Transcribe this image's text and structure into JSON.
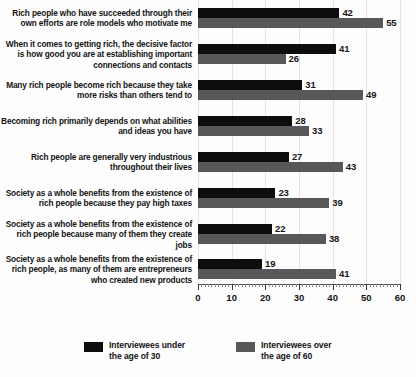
{
  "chart_data": {
    "type": "bar",
    "orientation": "horizontal",
    "title": "",
    "subtitle": "",
    "xlabel": "",
    "ylabel": "",
    "xlim": [
      0,
      60
    ],
    "xticks": [
      0,
      10,
      20,
      30,
      40,
      50,
      60
    ],
    "xtick_labels": [
      "0",
      "10",
      "20",
      "30",
      "40",
      "50",
      "60"
    ],
    "grid": true,
    "legend_position": "bottom",
    "categories": [
      "Rich people who have succeeded through their own efforts are role models who motivate me",
      "When it comes to getting rich, the decisive factor is how good you are at establishing important connections and contacts",
      "Many rich people become rich because they take more risks than others tend to",
      "Becoming rich primarily depends on what abilities and ideas you have",
      "Rich people are generally very industrious throughout their lives",
      "Society as a whole benefits from the existence of rich people because they pay high taxes",
      "Society as a whole benefits from the existence of rich people because many of them they create jobs",
      "Society as a whole benefits from the existence of rich people, as many of them are entrepreneurs who created new products"
    ],
    "series": [
      {
        "name": "Interviewees under the age of 30",
        "color": "#0d0d0d",
        "values": [
          42,
          41,
          31,
          28,
          27,
          23,
          22,
          19
        ]
      },
      {
        "name": "Interviewees over the age of 60",
        "color": "#58585a",
        "values": [
          55,
          26,
          49,
          33,
          43,
          39,
          38,
          41
        ]
      }
    ]
  },
  "legend": {
    "items": [
      {
        "label": "Interviewees under\nthe age of 30",
        "color": "#0d0d0d"
      },
      {
        "label": "Interviewees over\nthe age of 60",
        "color": "#58585a"
      }
    ]
  },
  "colors": {
    "young": "#0d0d0d",
    "old": "#58585a",
    "grid": "#e3e3e6",
    "axis": "#4a4a4a",
    "text": "#141414",
    "background": "#fdfdfd"
  }
}
